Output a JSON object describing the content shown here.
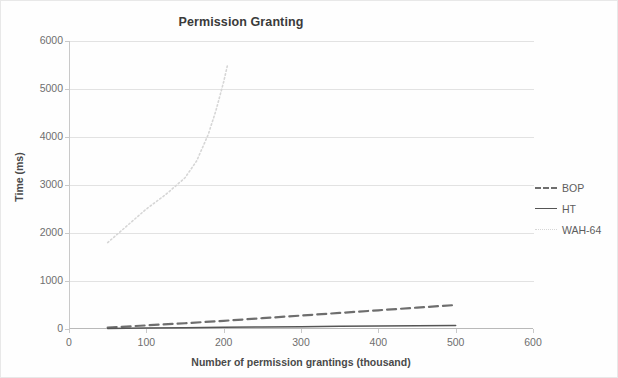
{
  "chart_data": {
    "type": "line",
    "title": "Permission Granting",
    "xlabel": "Number of permission grantings (thousand)",
    "ylabel": "Time (ms)",
    "xlim": [
      0,
      600
    ],
    "ylim": [
      0,
      6000
    ],
    "xticks": [
      "0",
      "100",
      "200",
      "300",
      "400",
      "500",
      "600"
    ],
    "yticks": [
      "0",
      "1000",
      "2000",
      "3000",
      "4000",
      "5000",
      "6000"
    ],
    "grid": "horizontal",
    "legend_position": "right",
    "series": [
      {
        "name": "BOP",
        "style": "dashed",
        "color": "#6e6e6e",
        "x": [
          50,
          100,
          150,
          200,
          250,
          300,
          350,
          400,
          450,
          500
        ],
        "values": [
          30,
          75,
          120,
          170,
          225,
          280,
          335,
          390,
          445,
          500
        ]
      },
      {
        "name": "HT",
        "style": "solid",
        "color": "#555555",
        "x": [
          50,
          100,
          150,
          200,
          250,
          300,
          350,
          400,
          450,
          500
        ],
        "values": [
          12,
          20,
          28,
          35,
          42,
          48,
          55,
          62,
          68,
          75
        ]
      },
      {
        "name": "WAH-64",
        "style": "dotted",
        "color": "#d6d6d6",
        "x": [
          50,
          75,
          100,
          125,
          150,
          165,
          180,
          190,
          200,
          205
        ],
        "values": [
          1800,
          2150,
          2500,
          2800,
          3150,
          3500,
          4050,
          4550,
          5150,
          5500
        ]
      }
    ]
  },
  "legend": {
    "items": [
      {
        "label": "BOP"
      },
      {
        "label": "HT"
      },
      {
        "label": "WAH-64"
      }
    ]
  }
}
